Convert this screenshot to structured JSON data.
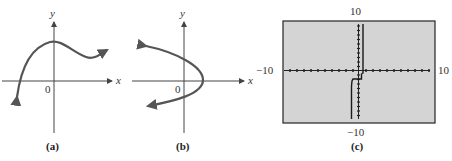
{
  "panels": [
    {
      "id": "a",
      "caption": "(a)",
      "x_axis_label": "x",
      "y_axis_label": "y",
      "origin_label": "0",
      "curve": "cubic-like curve, rising from lower left, local max near y-axis, local min right, rising to right"
    },
    {
      "id": "b",
      "caption": "(b)",
      "x_axis_label": "x",
      "y_axis_label": "y",
      "origin_label": "0",
      "curve": "sideways parabola opening left, vertex right of y-axis"
    },
    {
      "id": "c",
      "caption": "(c)",
      "window": {
        "ymax_label": "10",
        "ymin_label": "−10",
        "xmin_label": "−10",
        "xmax_label": "10"
      },
      "screen_color": "#d4d4d4"
    }
  ],
  "colors": {
    "curve": "#555555",
    "axis": "#444444",
    "screen_bg": "#d4d4d4",
    "screen_border": "#333333"
  }
}
